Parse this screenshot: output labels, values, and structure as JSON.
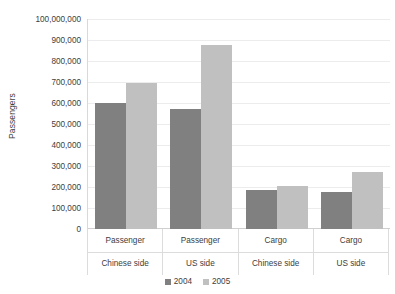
{
  "chart_data": {
    "type": "bar",
    "title": "",
    "xlabel": "",
    "ylabel": "Passengers",
    "ylim": [
      0,
      1000000
    ],
    "ytick_step": 100000,
    "grid": true,
    "legend_position": "bottom",
    "categories": [
      "Passenger",
      "Passenger",
      "Cargo",
      "Cargo"
    ],
    "subcategories": [
      "Chinese side",
      "US side",
      "Chinese side",
      "US side"
    ],
    "ytick_labels": [
      "100,000,000",
      "900,000",
      "800,000",
      "700,000",
      "600,000",
      "500,000",
      "400,000",
      "300,000",
      "200,000",
      "100,000",
      "0"
    ],
    "ytick_values": [
      1000000,
      900000,
      800000,
      700000,
      600000,
      500000,
      400000,
      300000,
      200000,
      100000,
      0
    ],
    "series": [
      {
        "name": "2004",
        "color": "#808080",
        "values": [
          600000,
          570000,
          185000,
          175000
        ]
      },
      {
        "name": "2005",
        "color": "#c0c0c0",
        "values": [
          695000,
          875000,
          205000,
          270000
        ]
      }
    ]
  },
  "axis": {
    "y_title": "Passengers"
  },
  "legend": {
    "items": [
      {
        "label": "2004",
        "color": "#808080"
      },
      {
        "label": "2005",
        "color": "#c0c0c0"
      }
    ]
  }
}
